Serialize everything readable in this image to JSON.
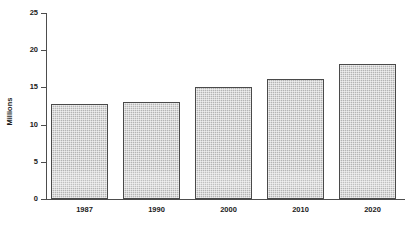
{
  "chart_data": {
    "type": "bar",
    "title": "",
    "xlabel": "",
    "ylabel": "Millions",
    "categories": [
      "1987",
      "1990",
      "2000",
      "2010",
      "2020"
    ],
    "values": [
      12.8,
      13.1,
      15.1,
      16.1,
      18.2
    ],
    "ylim": [
      0,
      25
    ],
    "yticks": [
      "0",
      "5",
      "10",
      "15",
      "20",
      "25"
    ],
    "ytick_values": [
      0,
      5,
      10,
      15,
      20,
      25
    ],
    "grid": false,
    "legend": null,
    "series": [
      {
        "name": "Millions",
        "values": [
          12.8,
          13.1,
          15.1,
          16.1,
          18.2
        ]
      }
    ],
    "colors": {
      "bar_fill": "#b4b4b4",
      "bar_border": "#4a4a4a",
      "axis": "#4d4d4d",
      "text": "#1a1a1a",
      "background": "#ffffff"
    }
  }
}
